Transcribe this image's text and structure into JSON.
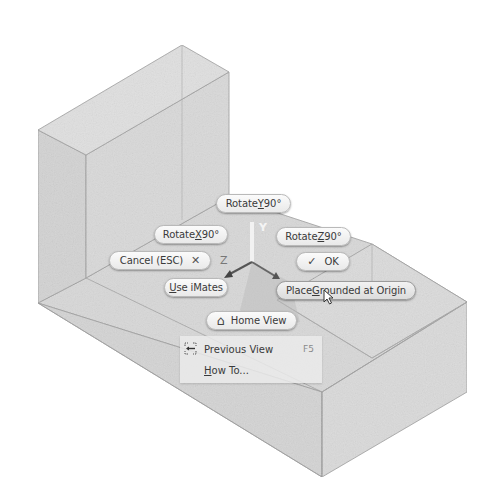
{
  "viewport": {
    "background": "#ffffff",
    "model_face_colors": {
      "top": "#dedede",
      "left": "#d2d2d2",
      "front": "#d9d9d9",
      "floor": "#d7d7d7",
      "edge": "#9a9a9a"
    }
  },
  "triad": {
    "y_label": "Y",
    "z_label": "Z",
    "axis_color": "#555555"
  },
  "buttons": {
    "rotate_y": {
      "prefix": "Rotate ",
      "mnemonic": "Y",
      "suffix": " 90°"
    },
    "rotate_x": {
      "prefix": "Rotate ",
      "mnemonic": "X",
      "suffix": " 90°"
    },
    "rotate_z": {
      "prefix": "Rotate ",
      "mnemonic": "Z",
      "suffix": " 90°"
    },
    "cancel": {
      "label": "Cancel (ESC)",
      "icon": "✕"
    },
    "ok": {
      "icon": "✓",
      "label": "OK"
    },
    "use_imates": {
      "mnemonic": "U",
      "rest": "se iMates"
    },
    "place_grounded": {
      "prefix": "Place ",
      "mnemonic": "G",
      "rest": "rounded at Origin"
    },
    "home_view": {
      "label": "Home View",
      "icon": "⌂"
    }
  },
  "menu": {
    "items": [
      {
        "label": "Previous View",
        "shortcut": "F5",
        "icon": "previous-view-icon"
      },
      {
        "mnemonic": "H",
        "rest": "ow To...",
        "shortcut": ""
      }
    ]
  }
}
